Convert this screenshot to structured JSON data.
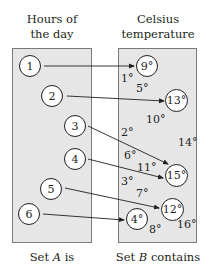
{
  "headers": {
    "left": [
      "Hours of",
      "the day"
    ],
    "right": [
      "Celsius",
      "temperature"
    ]
  },
  "set_a": {
    "elements": [
      "1",
      "2",
      "3",
      "4",
      "5",
      "6"
    ]
  },
  "set_b": {
    "circled": [
      "9°",
      "13°",
      "15°",
      "12°",
      "4°"
    ],
    "others": [
      "1°",
      "5°",
      "10°",
      "14°",
      "2°",
      "6°",
      "11°",
      "3°",
      "7°",
      "8°",
      "16°"
    ]
  },
  "mapping": [
    {
      "from": "1",
      "to": "9°"
    },
    {
      "from": "2",
      "to": "13°"
    },
    {
      "from": "3",
      "to": "15°"
    },
    {
      "from": "4",
      "to": "15°"
    },
    {
      "from": "5",
      "to": "12°"
    },
    {
      "from": "6",
      "to": "4°"
    }
  ],
  "footers": {
    "left_prefix": "Set ",
    "left_var": "A",
    "left_suffix": " is",
    "right_prefix": "Set ",
    "right_var": "B",
    "right_suffix": " contains"
  },
  "colors": {
    "box_fill": "#e6e6e6",
    "box_border": "#7a7a7a",
    "ink": "#231f20"
  }
}
